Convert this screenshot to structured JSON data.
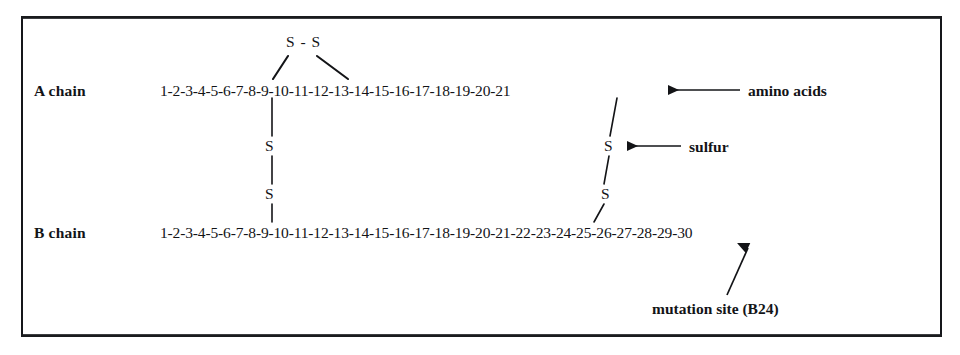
{
  "figure": {
    "ink_color": "#131417"
  },
  "chains": {
    "a": {
      "label": "A chain",
      "sequence": "1-2-3-4-5-6-7-8-9-10-11-12-13-14-15-16-17-18-19-20-21",
      "residue_count": 21
    },
    "b": {
      "label": "B chain",
      "sequence": "1-2-3-4-5-6-7-8-9-10-11-12-13-14-15-16-17-18-19-20-21-22-23-24-25-26-27-28-29-30",
      "residue_count": 30
    }
  },
  "bonds": {
    "intrachain_top": {
      "label": "S - S",
      "from_residue": "A7",
      "to_residue": "A11"
    },
    "interchain_left": {
      "upper_atom": "S",
      "lower_atom": "S",
      "from_residue": "A7",
      "to_residue": "B7"
    },
    "interchain_right": {
      "upper_atom": "S",
      "lower_atom": "S",
      "from_residue": "A20",
      "to_residue": "B19"
    }
  },
  "annotations": {
    "amino_acids": {
      "text": "amino acids",
      "arrow": "left-arrow",
      "points_to": "A chain sequence"
    },
    "sulfur": {
      "text": "sulfur",
      "arrow": "left-arrow",
      "points_to": "sulfur atom"
    },
    "mutation_site": {
      "text": "mutation site (B24)",
      "arrow": "up-arrow",
      "points_to": "B24"
    }
  }
}
